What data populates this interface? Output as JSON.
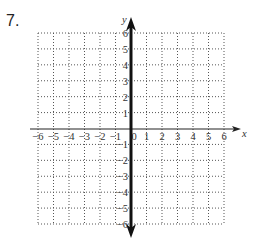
{
  "problem": {
    "number_label": "7."
  },
  "graph": {
    "x_axis_label": "x",
    "y_axis_label": "y",
    "x_range": [
      -6,
      6
    ],
    "y_range": [
      -6,
      6
    ],
    "x_tick_labels": [
      "−6",
      "−5",
      "−4",
      "−3",
      "−2",
      "−1",
      "0",
      "1",
      "2",
      "3",
      "4",
      "5",
      "6"
    ],
    "y_tick_labels_positive": [
      "1",
      "2",
      "3",
      "4",
      "5",
      "6"
    ],
    "y_tick_labels_negative": [
      "−1",
      "−2",
      "−3",
      "−4",
      "−5",
      "−6"
    ],
    "grid_style": "dotted",
    "plotted_line": {
      "description": "vertical line x = 0 (bold, arrows both ends)",
      "equation": "x = 0"
    },
    "colors": {
      "grid": "#555555",
      "axis": "#222222",
      "plotted_line": "#111111"
    }
  }
}
